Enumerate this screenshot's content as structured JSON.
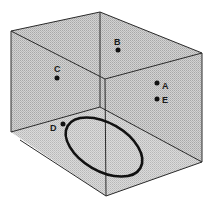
{
  "diagram": {
    "type": "3d-box-with-points",
    "colors": {
      "face_fill": "#c4c4c4",
      "edge": "#2a2a2a",
      "point": "#111111",
      "ellipse": "#111111",
      "background": "#ffffff"
    },
    "points": [
      {
        "id": "A",
        "label": "A",
        "face": "right"
      },
      {
        "id": "B",
        "label": "B",
        "face": "top-back"
      },
      {
        "id": "C",
        "label": "C",
        "face": "left"
      },
      {
        "id": "D",
        "label": "D",
        "face": "floor"
      },
      {
        "id": "E",
        "label": "E",
        "face": "right"
      }
    ],
    "ellipse": {
      "description": "loop on floor of box"
    }
  }
}
